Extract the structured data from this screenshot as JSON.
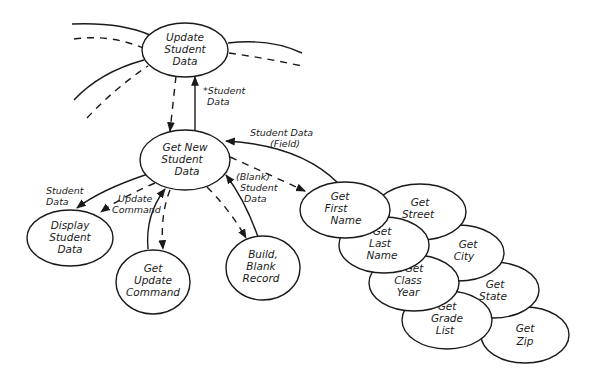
{
  "diagram": {
    "type": "structure-chart",
    "nodes": [
      {
        "id": "update",
        "lines": [
          "Update",
          "Student",
          "Data"
        ]
      },
      {
        "id": "getnew",
        "lines": [
          "Get New",
          "Student",
          "Data"
        ]
      },
      {
        "id": "display",
        "lines": [
          "Display",
          "Student",
          "Data"
        ]
      },
      {
        "id": "getcmd",
        "lines": [
          "Get",
          "Update",
          "Command"
        ]
      },
      {
        "id": "build",
        "lines": [
          "Build,",
          "Blank",
          "Record"
        ]
      },
      {
        "id": "first",
        "lines": [
          "Get",
          "First",
          "Name"
        ]
      },
      {
        "id": "street",
        "lines": [
          "Get",
          "Street"
        ]
      },
      {
        "id": "last",
        "lines": [
          "Get",
          "Last",
          "Name"
        ]
      },
      {
        "id": "city",
        "lines": [
          "Get",
          "City"
        ]
      },
      {
        "id": "classyear",
        "lines": [
          "Get",
          "Class",
          "Year"
        ]
      },
      {
        "id": "state",
        "lines": [
          "Get",
          "State"
        ]
      },
      {
        "id": "grade",
        "lines": [
          "Get",
          "Grade",
          "List"
        ]
      },
      {
        "id": "zip",
        "lines": [
          "Get",
          "Zip"
        ]
      }
    ],
    "edge_labels": {
      "update_getnew": [
        "*Student",
        "Data"
      ],
      "first_getnew": [
        "Student Data",
        "(Field)"
      ],
      "build_getnew": [
        "(Blank)",
        "Student",
        "Data"
      ],
      "getnew_display": [
        "Student",
        "Data"
      ],
      "getcmd_display": [
        "Update",
        "Command"
      ]
    }
  }
}
